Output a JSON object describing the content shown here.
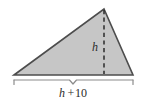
{
  "figure": {
    "name": "triangle-with-height-and-base-labels",
    "background_color": "#ffffff",
    "shape": {
      "kind": "triangle",
      "fill_color": "#c6c6c6",
      "stroke_color": "#4d4d4d",
      "vertices": [
        {
          "name": "bottom-left",
          "x": 14,
          "y": 75
        },
        {
          "name": "apex",
          "x": 104,
          "y": 9
        },
        {
          "name": "bottom-right",
          "x": 133,
          "y": 75
        }
      ]
    },
    "height_line": {
      "name": "dashed-height-segment",
      "style": "dashed",
      "stroke_color": "#2b2b2b",
      "x": 104,
      "y_top": 9,
      "y_bottom": 75
    },
    "height_label": {
      "text": "h",
      "x": 95,
      "y": 51
    },
    "base_brace": {
      "name": "base-measurement-brace",
      "stroke_color": "#8c8c8c",
      "x_left": 14,
      "x_right": 133,
      "y": 80,
      "notch_x": 73,
      "notch_depth": 4,
      "tick_depth": 5
    },
    "base_label": {
      "variable": "h",
      "operator": "+",
      "constant": "10",
      "full_text": "h + 10",
      "x": 73,
      "y": 97
    }
  }
}
